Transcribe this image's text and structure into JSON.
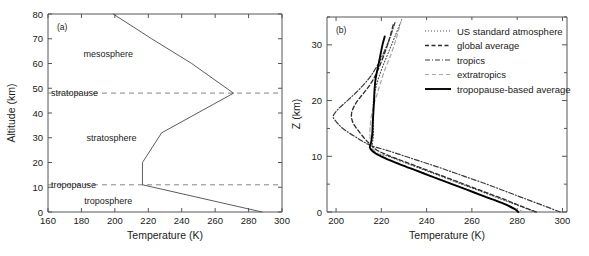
{
  "figure": {
    "background": "#ffffff",
    "line_color": "#1a1a1a"
  },
  "panel_a": {
    "tag": "(a)",
    "xlabel": "Temperature (K)",
    "ylabel": "Altitude (km)",
    "xticks": [
      "160",
      "180",
      "200",
      "220",
      "240",
      "260",
      "280",
      "300"
    ],
    "yticks": [
      "0",
      "10",
      "20",
      "30",
      "40",
      "50",
      "60",
      "70",
      "80"
    ],
    "region_labels": [
      {
        "text": "mesosphere",
        "x": 196,
        "y": 64
      },
      {
        "text": "stratosphere",
        "x": 198,
        "y": 30
      },
      {
        "text": "troposphere",
        "x": 196,
        "y": 4.5
      }
    ],
    "pause_labels": [
      {
        "text": "stratopause",
        "altitude": 48
      },
      {
        "text": "tropopause",
        "altitude": 11
      }
    ]
  },
  "panel_b": {
    "tag": "(b)",
    "xlabel": "Temperature (K)",
    "ylabel": "Z (km)",
    "xticks": [
      "200",
      "220",
      "240",
      "260",
      "280",
      "300"
    ],
    "yticks": [
      "0",
      "10",
      "20",
      "30"
    ],
    "legend": [
      {
        "label": "US standard atmosphere",
        "style": "dotted",
        "color": "#4d4d4d"
      },
      {
        "label": "global average",
        "style": "dashed",
        "color": "#2b2b2b"
      },
      {
        "label": "tropics",
        "style": "dashdot",
        "color": "#3a3a3a"
      },
      {
        "label": "extratropics",
        "style": "dashed-light",
        "color": "#a8a8a8"
      },
      {
        "label": "tropopause-based average",
        "style": "solid",
        "color": "#000000"
      }
    ]
  },
  "chart_data": [
    {
      "type": "line",
      "title": "(a) US Standard Atmosphere temperature profile",
      "xlabel": "Temperature (K)",
      "ylabel": "Altitude (km)",
      "xlim": [
        160,
        300
      ],
      "ylim": [
        0,
        80
      ],
      "xticks": [
        160,
        180,
        200,
        220,
        240,
        260,
        280,
        300
      ],
      "yticks": [
        0,
        10,
        20,
        30,
        40,
        50,
        60,
        70,
        80
      ],
      "grid": false,
      "annotations": [
        {
          "text": "mesosphere",
          "x": 196,
          "y": 64
        },
        {
          "text": "stratosphere",
          "x": 198,
          "y": 30
        },
        {
          "text": "troposphere",
          "x": 196,
          "y": 4.5
        },
        {
          "text": "stratopause",
          "y": 48,
          "type": "hline"
        },
        {
          "text": "tropopause",
          "y": 11,
          "type": "hline"
        }
      ],
      "series": [
        {
          "name": "US standard atmosphere",
          "points": [
            [
              288.0,
              0
            ],
            [
              216.5,
              11
            ],
            [
              216.5,
              20
            ],
            [
              228.0,
              32
            ],
            [
              271.0,
              48
            ],
            [
              246.0,
              60
            ],
            [
              222.0,
              70
            ],
            [
              199.0,
              80
            ]
          ]
        }
      ]
    },
    {
      "type": "line",
      "title": "(b) Lower-stratosphere temperature profiles",
      "xlabel": "Temperature (K)",
      "ylabel": "Z (km)",
      "xlim": [
        196,
        302
      ],
      "ylim": [
        0,
        35
      ],
      "xticks": [
        200,
        220,
        240,
        260,
        280,
        300
      ],
      "yticks": [
        0,
        10,
        20,
        30
      ],
      "grid": false,
      "legend_position": "upper right",
      "series": [
        {
          "name": "US standard atmosphere",
          "style": "dotted",
          "points": [
            [
              288.0,
              0
            ],
            [
              281.5,
              1
            ],
            [
              275.0,
              2
            ],
            [
              268.5,
              3
            ],
            [
              262.0,
              4
            ],
            [
              255.5,
              5
            ],
            [
              249.0,
              6
            ],
            [
              242.5,
              7
            ],
            [
              236.0,
              8
            ],
            [
              229.5,
              9
            ],
            [
              223.0,
              10
            ],
            [
              216.5,
              11
            ],
            [
              216.5,
              14
            ],
            [
              216.5,
              17
            ],
            [
              216.5,
              20
            ],
            [
              218.0,
              23
            ],
            [
              220.5,
              26
            ],
            [
              223.5,
              29
            ],
            [
              226.5,
              32
            ],
            [
              229.0,
              34.5
            ]
          ]
        },
        {
          "name": "global average",
          "style": "dashed",
          "points": [
            [
              288.5,
              0
            ],
            [
              282.0,
              1
            ],
            [
              276.0,
              2
            ],
            [
              269.5,
              3
            ],
            [
              263.0,
              4
            ],
            [
              256.5,
              5
            ],
            [
              250.0,
              6
            ],
            [
              243.5,
              7
            ],
            [
              237.0,
              8
            ],
            [
              230.5,
              9
            ],
            [
              224.0,
              10
            ],
            [
              218.5,
              11
            ],
            [
              215.5,
              12
            ],
            [
              213.0,
              13
            ],
            [
              210.0,
              14.5
            ],
            [
              207.5,
              16
            ],
            [
              206.8,
              17.5
            ],
            [
              208.0,
              19
            ],
            [
              210.5,
              20.5
            ],
            [
              213.5,
              22
            ],
            [
              216.0,
              23.5
            ],
            [
              218.5,
              25.5
            ],
            [
              221.0,
              28
            ],
            [
              223.5,
              31
            ],
            [
              225.5,
              34
            ]
          ]
        },
        {
          "name": "tropics",
          "style": "dashdot",
          "points": [
            [
              299.0,
              0
            ],
            [
              292.5,
              1
            ],
            [
              286.0,
              2
            ],
            [
              279.5,
              3
            ],
            [
              273.0,
              4
            ],
            [
              266.5,
              5
            ],
            [
              259.5,
              6
            ],
            [
              252.5,
              7
            ],
            [
              245.5,
              8
            ],
            [
              238.0,
              9
            ],
            [
              230.5,
              10
            ],
            [
              223.0,
              11
            ],
            [
              215.0,
              12
            ],
            [
              208.5,
              13.5
            ],
            [
              203.0,
              15
            ],
            [
              199.5,
              16.5
            ],
            [
              198.8,
              17.3
            ],
            [
              201.0,
              18.5
            ],
            [
              205.0,
              20
            ],
            [
              209.0,
              21.5
            ],
            [
              212.5,
              23
            ],
            [
              215.5,
              24.5
            ],
            [
              218.5,
              26.5
            ],
            [
              221.5,
              29
            ],
            [
              224.0,
              31.5
            ],
            [
              226.0,
              34
            ]
          ]
        },
        {
          "name": "extratropics",
          "style": "dashed-light",
          "points": [
            [
              283.0,
              0
            ],
            [
              277.0,
              1
            ],
            [
              271.0,
              2
            ],
            [
              264.5,
              3
            ],
            [
              258.0,
              4
            ],
            [
              251.5,
              5
            ],
            [
              245.0,
              6
            ],
            [
              238.5,
              7
            ],
            [
              232.0,
              8
            ],
            [
              226.0,
              9
            ],
            [
              220.5,
              10
            ],
            [
              217.0,
              11
            ],
            [
              215.5,
              12
            ],
            [
              215.0,
              13.5
            ],
            [
              215.0,
              15
            ],
            [
              215.5,
              17
            ],
            [
              216.5,
              19
            ],
            [
              218.0,
              21
            ],
            [
              219.5,
              23
            ],
            [
              221.5,
              25.5
            ],
            [
              224.0,
              28
            ],
            [
              226.5,
              31
            ],
            [
              228.5,
              34
            ]
          ]
        },
        {
          "name": "tropopause-based average",
          "style": "solid",
          "points": [
            [
              280.5,
              0
            ],
            [
              279.0,
              0.5
            ],
            [
              274.0,
              1.5
            ],
            [
              267.5,
              2.5
            ],
            [
              261.0,
              3.5
            ],
            [
              254.5,
              4.5
            ],
            [
              248.0,
              5.5
            ],
            [
              241.5,
              6.5
            ],
            [
              235.0,
              7.5
            ],
            [
              228.5,
              8.5
            ],
            [
              222.5,
              9.5
            ],
            [
              217.5,
              10.5
            ],
            [
              215.0,
              11.5
            ],
            [
              215.5,
              12.5
            ],
            [
              216.0,
              14
            ],
            [
              216.2,
              16
            ],
            [
              216.5,
              18
            ],
            [
              216.8,
              20
            ],
            [
              217.0,
              22
            ],
            [
              217.5,
              24
            ],
            [
              218.5,
              26
            ],
            [
              219.5,
              28
            ],
            [
              220.5,
              30
            ],
            [
              221.5,
              31.5
            ]
          ]
        }
      ]
    }
  ]
}
